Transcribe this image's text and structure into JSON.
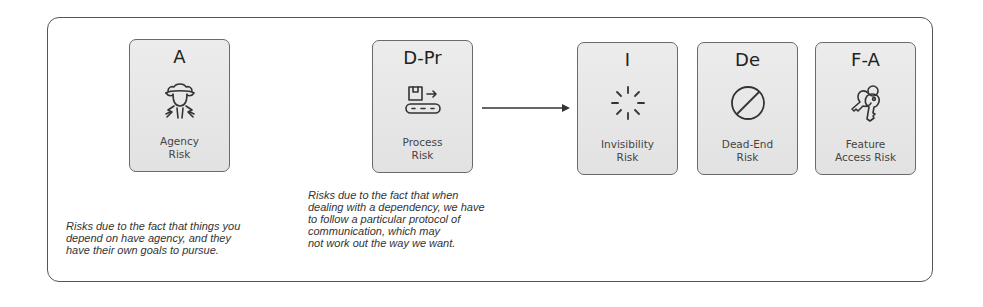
{
  "cards": [
    {
      "abbr": "A",
      "label": "Agency\nRisk",
      "icon": "spy-person-icon"
    },
    {
      "abbr": "D-Pr",
      "label": "Process\nRisk",
      "icon": "conveyor-belt-icon"
    },
    {
      "abbr": "I",
      "label": "Invisibility\nRisk",
      "icon": "sparkle-burst-icon"
    },
    {
      "abbr": "De",
      "label": "Dead-End\nRisk",
      "icon": "prohibited-icon"
    },
    {
      "abbr": "F-A",
      "label": "Feature\nAccess Risk",
      "icon": "keys-icon"
    }
  ],
  "descriptions": {
    "agency": "Risks due to the fact that things you\ndepend on have agency, and they\nhave their own goals to pursue.",
    "process": "Risks due to the fact that when\ndealing with a dependency, we have\nto follow a particular protocol of\ncommunication, which may\nnot work out the way we want."
  },
  "colors": {
    "card_bg": "#e6e6e6",
    "border": "#555555",
    "text": "#333333"
  }
}
